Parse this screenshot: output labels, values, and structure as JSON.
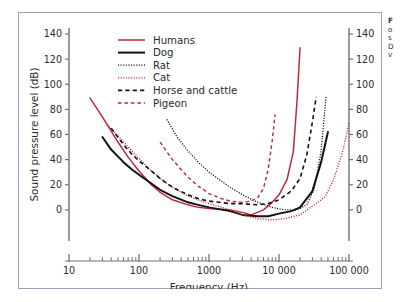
{
  "figure": {
    "border_color": "#9aa3b8",
    "background": "#ffffff"
  },
  "caption": {
    "lines": [
      "F",
      "o",
      "s",
      "D",
      "v"
    ],
    "note": "caption text cropped at right edge of screenshot"
  },
  "chart_data": {
    "type": "line",
    "title": "",
    "xlabel": "Frequency  (Hz)",
    "ylabel": "Sound pressure level (dB)",
    "xscale": "log",
    "xlim": [
      10,
      100000
    ],
    "ylim": [
      -20,
      140
    ],
    "grid": false,
    "legend_position": "top-left-inside",
    "xticks": [
      10,
      100,
      1000,
      10000,
      100000
    ],
    "xticklabels": [
      "10",
      "100",
      "1000",
      "10 000",
      "100 000"
    ],
    "yticks": [
      0,
      20,
      40,
      60,
      80,
      100,
      120,
      140
    ],
    "yticklabels": [
      "0",
      "20",
      "40",
      "60",
      "80",
      "100",
      "120",
      "140"
    ],
    "right_axis": {
      "visible": true,
      "ticks": [
        0,
        20,
        40,
        60,
        80,
        100,
        120,
        140
      ],
      "ticklabels": [
        "0",
        "20",
        "40",
        "60",
        "80",
        "100",
        "120",
        "140"
      ]
    },
    "series": [
      {
        "name": "Humans",
        "color": "#c0283c",
        "style": "solid",
        "width": 1.5,
        "points": [
          [
            20,
            89
          ],
          [
            30,
            74
          ],
          [
            50,
            54
          ],
          [
            70,
            42
          ],
          [
            100,
            31
          ],
          [
            150,
            20
          ],
          [
            200,
            14
          ],
          [
            300,
            8
          ],
          [
            500,
            4
          ],
          [
            700,
            2
          ],
          [
            1000,
            1
          ],
          [
            2000,
            0
          ],
          [
            3000,
            -2
          ],
          [
            4000,
            -4
          ],
          [
            6000,
            0
          ],
          [
            8000,
            6
          ],
          [
            10000,
            12
          ],
          [
            13000,
            24
          ],
          [
            16000,
            46
          ],
          [
            18000,
            85
          ],
          [
            20000,
            129
          ]
        ]
      },
      {
        "name": "Dog",
        "color": "#111111",
        "style": "solid",
        "width": 2.0,
        "points": [
          [
            30,
            58
          ],
          [
            40,
            48
          ],
          [
            60,
            38
          ],
          [
            80,
            32
          ],
          [
            100,
            28
          ],
          [
            150,
            21
          ],
          [
            200,
            16
          ],
          [
            300,
            11
          ],
          [
            500,
            6
          ],
          [
            700,
            4
          ],
          [
            1000,
            2
          ],
          [
            2000,
            -1
          ],
          [
            3000,
            -4
          ],
          [
            5000,
            -5
          ],
          [
            7000,
            -5
          ],
          [
            10000,
            -3
          ],
          [
            15000,
            -1
          ],
          [
            20000,
            2
          ],
          [
            30000,
            15
          ],
          [
            40000,
            38
          ],
          [
            50000,
            62
          ]
        ]
      },
      {
        "name": "Rat",
        "color": "#111111",
        "style": "dotted",
        "width": 1.3,
        "points": [
          [
            250,
            72
          ],
          [
            350,
            58
          ],
          [
            500,
            47
          ],
          [
            700,
            38
          ],
          [
            1000,
            30
          ],
          [
            1500,
            23
          ],
          [
            2000,
            18
          ],
          [
            3000,
            12
          ],
          [
            5000,
            6
          ],
          [
            8000,
            2
          ],
          [
            12000,
            0
          ],
          [
            18000,
            0
          ],
          [
            25000,
            4
          ],
          [
            32000,
            17
          ],
          [
            40000,
            47
          ],
          [
            47000,
            90
          ]
        ]
      },
      {
        "name": "Cat",
        "color": "#c0283c",
        "style": "dotted",
        "width": 1.3,
        "points": [
          [
            35,
            68
          ],
          [
            50,
            59
          ],
          [
            70,
            50
          ],
          [
            100,
            41
          ],
          [
            150,
            31
          ],
          [
            200,
            25
          ],
          [
            300,
            18
          ],
          [
            500,
            11
          ],
          [
            700,
            8
          ],
          [
            1000,
            5
          ],
          [
            2000,
            0
          ],
          [
            3000,
            -4
          ],
          [
            5000,
            -7
          ],
          [
            8000,
            -8
          ],
          [
            12000,
            -7
          ],
          [
            20000,
            -4
          ],
          [
            30000,
            3
          ],
          [
            45000,
            10
          ],
          [
            60000,
            24
          ],
          [
            80000,
            45
          ],
          [
            100000,
            69
          ]
        ]
      },
      {
        "name": "Horse and cattle",
        "color": "#111111",
        "style": "dashed",
        "width": 1.6,
        "points": [
          [
            40,
            65
          ],
          [
            60,
            52
          ],
          [
            80,
            44
          ],
          [
            100,
            39
          ],
          [
            150,
            31
          ],
          [
            200,
            25
          ],
          [
            300,
            18
          ],
          [
            500,
            12
          ],
          [
            700,
            9
          ],
          [
            1000,
            7
          ],
          [
            2000,
            5
          ],
          [
            3000,
            5
          ],
          [
            5000,
            4
          ],
          [
            7000,
            5
          ],
          [
            10000,
            8
          ],
          [
            15000,
            15
          ],
          [
            20000,
            25
          ],
          [
            25000,
            44
          ],
          [
            30000,
            70
          ],
          [
            34000,
            90
          ]
        ]
      },
      {
        "name": "Pigeon",
        "color": "#c0283c",
        "style": "dashed",
        "width": 1.4,
        "points": [
          [
            200,
            54
          ],
          [
            300,
            40
          ],
          [
            500,
            26
          ],
          [
            700,
            19
          ],
          [
            1000,
            13
          ],
          [
            1500,
            9
          ],
          [
            2000,
            7
          ],
          [
            3000,
            6
          ],
          [
            4000,
            7
          ],
          [
            5000,
            10
          ],
          [
            6000,
            17
          ],
          [
            7000,
            32
          ],
          [
            8000,
            55
          ],
          [
            8800,
            76
          ]
        ]
      }
    ]
  }
}
